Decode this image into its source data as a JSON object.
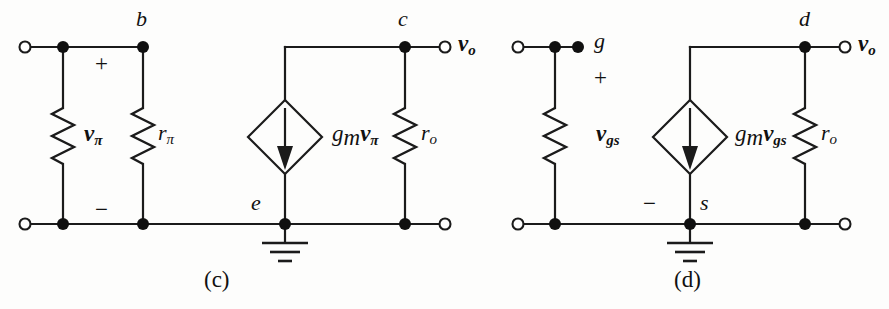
{
  "figure": {
    "kind": "small-signal-equivalent-circuits",
    "panels": [
      {
        "caption": "(c)",
        "model": "BJT hybrid-pi small-signal model",
        "nodes": [
          {
            "name": "b",
            "label": "b"
          },
          {
            "name": "e",
            "label": "e"
          },
          {
            "name": "c",
            "label": "c"
          }
        ],
        "polarity": {
          "plus": "+",
          "minus": "−"
        },
        "labels": {
          "control_voltage": {
            "base": "v",
            "sub": "π"
          },
          "input_resistor": {
            "base": "r",
            "sub": "π"
          },
          "output_resistor": {
            "base": "r",
            "sub": "o"
          },
          "dependent_source": {
            "g": "g",
            "g_sub": "m",
            "v": "v",
            "v_sub": "π"
          },
          "output_terminal": {
            "base": "v",
            "sub": "o"
          }
        },
        "source_type": "dependent current source, arrow pointing down"
      },
      {
        "caption": "(d)",
        "model": "FET small-signal model",
        "nodes": [
          {
            "name": "g",
            "label": "g"
          },
          {
            "name": "s",
            "label": "s"
          },
          {
            "name": "d",
            "label": "d"
          }
        ],
        "polarity": {
          "plus": "+",
          "minus": "−"
        },
        "labels": {
          "control_voltage": {
            "base": "v",
            "sub": "gs"
          },
          "output_resistor": {
            "base": "r",
            "sub": "o"
          },
          "dependent_source": {
            "g": "g",
            "g_sub": "m",
            "v": "v",
            "v_sub": "gs"
          },
          "output_terminal": {
            "base": "v",
            "sub": "o"
          }
        },
        "source_type": "dependent current source, arrow pointing down"
      }
    ],
    "colors": {
      "ink": "#1b1b1b",
      "paper": "#fdfdfc"
    }
  }
}
